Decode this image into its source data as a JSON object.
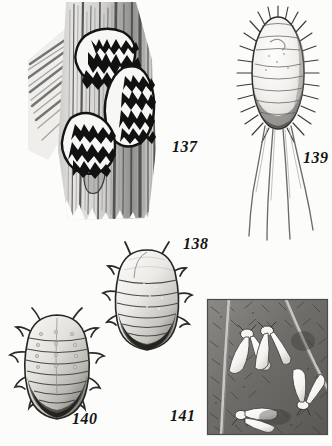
{
  "plate": {
    "type": "scientific-illustration-plate",
    "background_color": "#fcfcfb",
    "ink_color": "#141414",
    "width": 332,
    "height": 446,
    "figure_count": 5
  },
  "figures": [
    {
      "number": "137",
      "label_x": 172,
      "label_y": 147,
      "subject": "oyster-shell scale insects on bark",
      "description": "Three armored scale insects with dark jagged transverse markings clustered on vertically striated tree bark",
      "panel": {
        "x": 30,
        "y": 2,
        "width": 142,
        "height": 215
      }
    },
    {
      "number": "138",
      "label_x": 183,
      "label_y": 244,
      "subject": "segmented oval insect, dorsal view",
      "description": "Pear-shaped segmented body with short marginal legs and darkly shaded posterior abdomen",
      "panel": {
        "x": 104,
        "y": 240,
        "width": 88,
        "height": 112
      }
    },
    {
      "number": "139",
      "label_x": 303,
      "label_y": 158,
      "subject": "mealybug with marginal bristles and caudal filaments",
      "description": "Oval body ringed with radiating marginal spines and four long tail filaments trailing below",
      "panel": {
        "x": 236,
        "y": 6,
        "width": 82,
        "height": 225
      }
    },
    {
      "number": "140",
      "label_x": 72,
      "label_y": 419,
      "subject": "segmented oval insect with legs, dorsal view",
      "description": "Broad segmented body bearing pairs of legs and antennae, posterior segments darkly shaded",
      "panel": {
        "x": 12,
        "y": 305,
        "width": 92,
        "height": 114
      }
    },
    {
      "number": "141",
      "label_x": 170,
      "label_y": 416,
      "subject": "whiteflies on leaf underside",
      "description": "Square vignette of a veined leaf surface with six white-winged adult whiteflies",
      "panel": {
        "x": 207,
        "y": 299,
        "width": 121,
        "height": 136
      }
    }
  ]
}
